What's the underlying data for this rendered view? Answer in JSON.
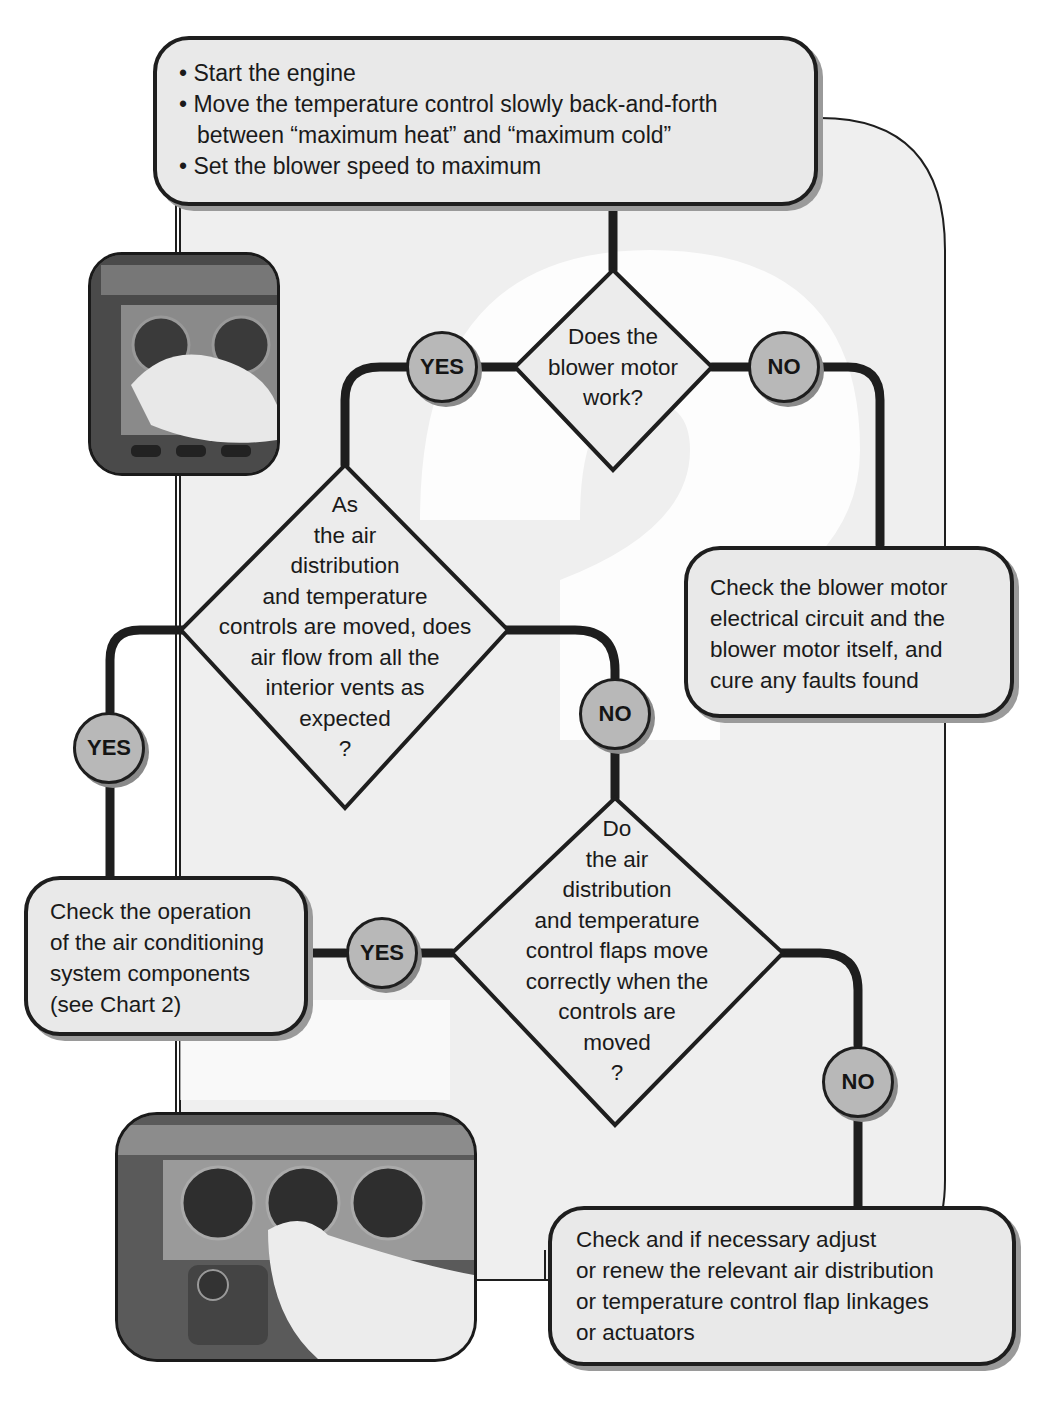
{
  "start_box": {
    "lines": [
      "• Start the engine",
      "• Move the temperature control slowly back-and-forth",
      "  between “maximum heat” and “maximum cold”",
      "• Set the blower speed to maximum"
    ]
  },
  "decision_1": {
    "lines": [
      "Does the",
      "blower motor",
      "work?"
    ]
  },
  "decision_2": {
    "lines": [
      "As",
      "the air",
      "distribution",
      "and temperature",
      "controls are moved, does",
      "air flow from all the",
      "interior vents as",
      "expected",
      "?"
    ]
  },
  "decision_3": {
    "lines": [
      "Do",
      "the air",
      "distribution",
      "and temperature",
      "control flaps move",
      "correctly when the",
      "controls are",
      "moved",
      "?"
    ]
  },
  "action_blower": {
    "lines": [
      "Check the blower motor",
      "electrical circuit and the",
      "blower motor itself, and",
      "cure any faults found"
    ]
  },
  "action_ac": {
    "lines": [
      "Check the operation",
      "of the air conditioning",
      "system components",
      "(see Chart 2)"
    ]
  },
  "action_flaps": {
    "lines": [
      "Check and if necessary adjust",
      "or renew the relevant air distribution",
      "or temperature control flap linkages",
      "or actuators"
    ]
  },
  "labels": {
    "d1_yes": "YES",
    "d1_no": "NO",
    "d2_yes": "YES",
    "d2_no": "NO",
    "d3_yes": "YES",
    "d3_no": "NO"
  },
  "photos": {
    "top": "photo-hand-adjusting-heater-control",
    "bottom": "photo-hand-adjusting-heater-control-closeup"
  },
  "colors": {
    "box_fill": "#e9e9e9",
    "bubble_fill": "#b8b8b8",
    "line": "#1e1e1e",
    "bg_panel": "#efefef"
  }
}
